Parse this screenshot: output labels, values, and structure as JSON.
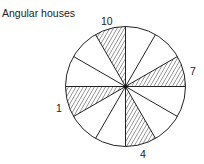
{
  "title": "Angular houses",
  "diagram": {
    "type": "house-wheel",
    "sectors": 12,
    "center": [
      125.5,
      86.5
    ],
    "radius": 60,
    "hatched_sector_start_angles_deg": [
      0,
      90,
      180,
      270
    ],
    "sector_span_deg": 30,
    "labels": [
      {
        "text": "10",
        "x": 101,
        "y": 25
      },
      {
        "text": "7",
        "x": 190,
        "y": 75
      },
      {
        "text": "1",
        "x": 56,
        "y": 112
      },
      {
        "text": "4",
        "x": 140,
        "y": 158
      }
    ],
    "line_color": "#222222",
    "hatch_color": "#333333"
  }
}
